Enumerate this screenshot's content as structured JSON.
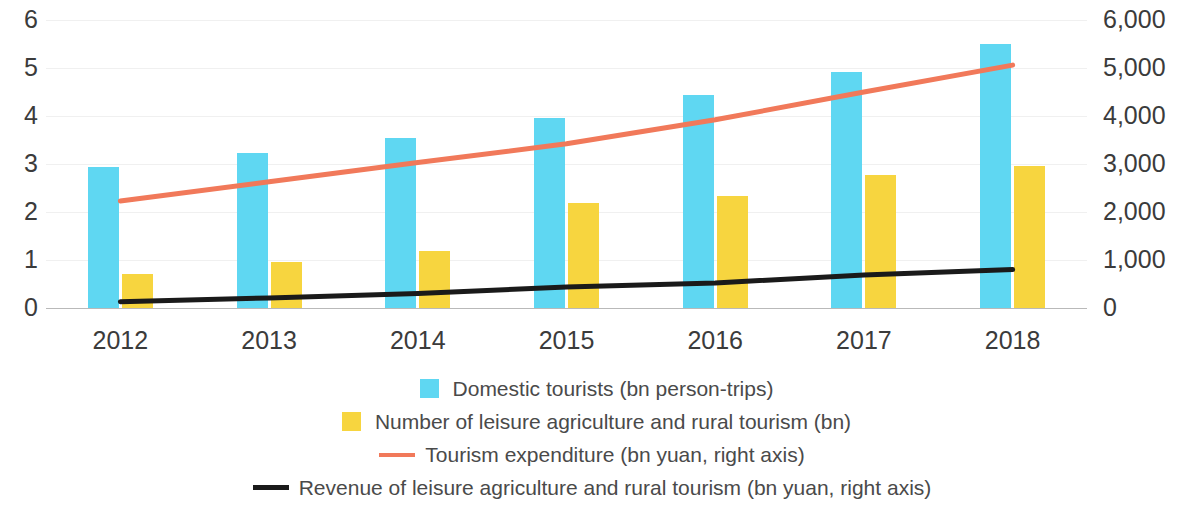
{
  "chart_data": {
    "type": "bar",
    "title": "",
    "xlabel": "",
    "ylabel": "",
    "categories": [
      "2012",
      "2013",
      "2014",
      "2015",
      "2016",
      "2017",
      "2018"
    ],
    "left_axis": {
      "ticks": [
        "0",
        "1",
        "2",
        "3",
        "4",
        "5",
        "6"
      ],
      "min": 0,
      "max": 6
    },
    "right_axis": {
      "ticks": [
        "0",
        "1,000",
        "2,000",
        "3,000",
        "4,000",
        "5,000",
        "6,000"
      ],
      "min": 0,
      "max": 6000
    },
    "grid": true,
    "legend_position": "bottom",
    "series": [
      {
        "name": "Domestic tourists (bn person-trips)",
        "type": "bar",
        "axis": "left",
        "color": "#5fd7f2",
        "values": [
          2.93,
          3.23,
          3.54,
          3.96,
          4.44,
          4.92,
          5.5
        ]
      },
      {
        "name": "Number of leisure agriculture and rural tourism (bn)",
        "type": "bar",
        "axis": "left",
        "color": "#f7d53f",
        "values": [
          0.71,
          0.95,
          1.18,
          2.18,
          2.34,
          2.78,
          2.96
        ]
      },
      {
        "name": "Tourism expenditure (bn yuan, right axis)",
        "type": "line",
        "axis": "right",
        "color": "#f1795a",
        "values": [
          2230,
          2630,
          3030,
          3420,
          3920,
          4500,
          5060
        ]
      },
      {
        "name": "Revenue of leisure agriculture and rural tourism (bn yuan, right axis)",
        "type": "line",
        "axis": "right",
        "color": "#1a1a1a",
        "values": [
          130,
          210,
          300,
          440,
          520,
          690,
          800
        ]
      }
    ]
  },
  "legend": {
    "items": [
      {
        "marker": "square-swatch-blue",
        "label": "Domestic tourists (bn person-trips)"
      },
      {
        "marker": "square-swatch-yellow",
        "label": "Number of leisure agriculture and rural tourism (bn)"
      },
      {
        "marker": "line-swatch-orange",
        "label": "Tourism expenditure (bn yuan, right axis)"
      },
      {
        "marker": "line-swatch-black",
        "label": "Revenue of leisure agriculture and rural tourism (bn yuan, right axis)"
      }
    ]
  }
}
